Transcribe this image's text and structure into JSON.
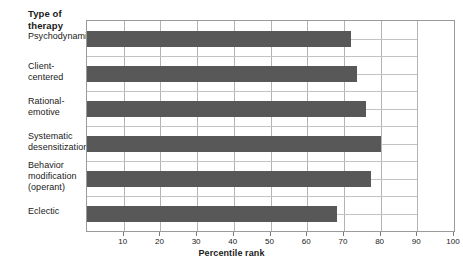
{
  "chart_data": {
    "type": "bar",
    "orientation": "horizontal",
    "title": "",
    "ylabel": "Type of\ntherapy",
    "xlabel": "Percentile rank",
    "categories": [
      "Psychodynamic",
      "Client-\ncentered",
      "Rational-\nemotive",
      "Systematic\ndesensitization",
      "Behavior\nmodification\n(operant)",
      "Eclectic"
    ],
    "values": [
      72,
      73.5,
      76,
      80,
      77.5,
      68
    ],
    "xlim": [
      0,
      100
    ],
    "xticks": [
      10,
      20,
      30,
      40,
      50,
      60,
      70,
      80,
      90,
      100
    ],
    "xtick_labels": [
      "10",
      "20",
      "30",
      "40",
      "50",
      "60",
      "70",
      "80",
      "90",
      "100"
    ],
    "grid": "vertical-and-horizontal",
    "legend": "none",
    "bar_color": "#585858",
    "gridline_color": "#b4b4b4",
    "axis_color": "#9a9a9a"
  }
}
